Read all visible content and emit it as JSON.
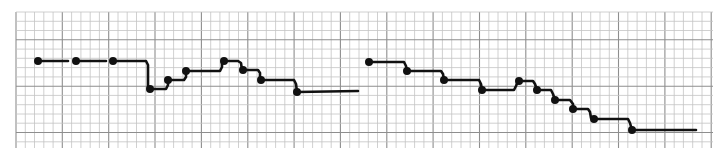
{
  "diagram": {
    "type": "step-trace-on-graph-paper",
    "background_color": "#ffffff",
    "grid": {
      "left": 16,
      "top": 12,
      "right": 713,
      "bottom": 148,
      "cell": 9.27,
      "major_every": 5,
      "minor_color": "#c4c4c4",
      "major_color": "#8e8e8e"
    },
    "ink_color": "#111111",
    "traces": [
      {
        "name": "trace-1",
        "segments": [
          [
            [
              38,
              61
            ],
            [
              68,
              61
            ]
          ],
          [
            [
              76,
              61
            ],
            [
              106,
              61
            ]
          ],
          [
            [
              113,
              61
            ],
            [
              146,
              61
            ],
            [
              148,
              65
            ],
            [
              148,
              89
            ],
            [
              150,
              89
            ],
            [
              166,
              89
            ],
            [
              168,
              85
            ],
            [
              168,
              80
            ],
            [
              184,
              80
            ],
            [
              186,
              77
            ],
            [
              186,
              71
            ],
            [
              220,
              71
            ],
            [
              222,
              67
            ],
            [
              222,
              61
            ],
            [
              238,
              61
            ],
            [
              241,
              63
            ],
            [
              242,
              70
            ],
            [
              258,
              70
            ],
            [
              260,
              73
            ],
            [
              260,
              80
            ],
            [
              294,
              80
            ],
            [
              296,
              84
            ],
            [
              297,
              92
            ],
            [
              358,
              91
            ]
          ]
        ],
        "dots": [
          [
            38,
            61
          ],
          [
            76,
            61
          ],
          [
            113,
            61
          ],
          [
            150,
            89
          ],
          [
            168,
            80
          ],
          [
            186,
            71
          ],
          [
            224,
            61
          ],
          [
            243,
            70
          ],
          [
            261,
            80
          ],
          [
            297,
            92
          ]
        ]
      },
      {
        "name": "trace-2",
        "segments": [
          [
            [
              369,
              62
            ],
            [
              404,
              62
            ],
            [
              406,
              66
            ],
            [
              407,
              71
            ],
            [
              441,
              71
            ],
            [
              443,
              74
            ],
            [
              444,
              80
            ],
            [
              479,
              80
            ],
            [
              481,
              84
            ],
            [
              482,
              90
            ],
            [
              514,
              90
            ],
            [
              516,
              86
            ],
            [
              518,
              81
            ],
            [
              533,
              81
            ],
            [
              535,
              84
            ],
            [
              537,
              90
            ],
            [
              551,
              90
            ],
            [
              553,
              94
            ],
            [
              555,
              100
            ],
            [
              570,
              100
            ],
            [
              573,
              104
            ],
            [
              573,
              109
            ],
            [
              588,
              109
            ],
            [
              590,
              112
            ],
            [
              591,
              118
            ],
            [
              594,
              119
            ],
            [
              628,
              119
            ],
            [
              630,
              123
            ],
            [
              632,
              130
            ],
            [
              696,
              130
            ]
          ]
        ],
        "dots": [
          [
            369,
            62
          ],
          [
            407,
            71
          ],
          [
            444,
            80
          ],
          [
            482,
            90
          ],
          [
            519,
            81
          ],
          [
            537,
            90
          ],
          [
            555,
            100
          ],
          [
            573,
            109
          ],
          [
            594,
            119
          ],
          [
            632,
            130
          ]
        ]
      }
    ]
  }
}
